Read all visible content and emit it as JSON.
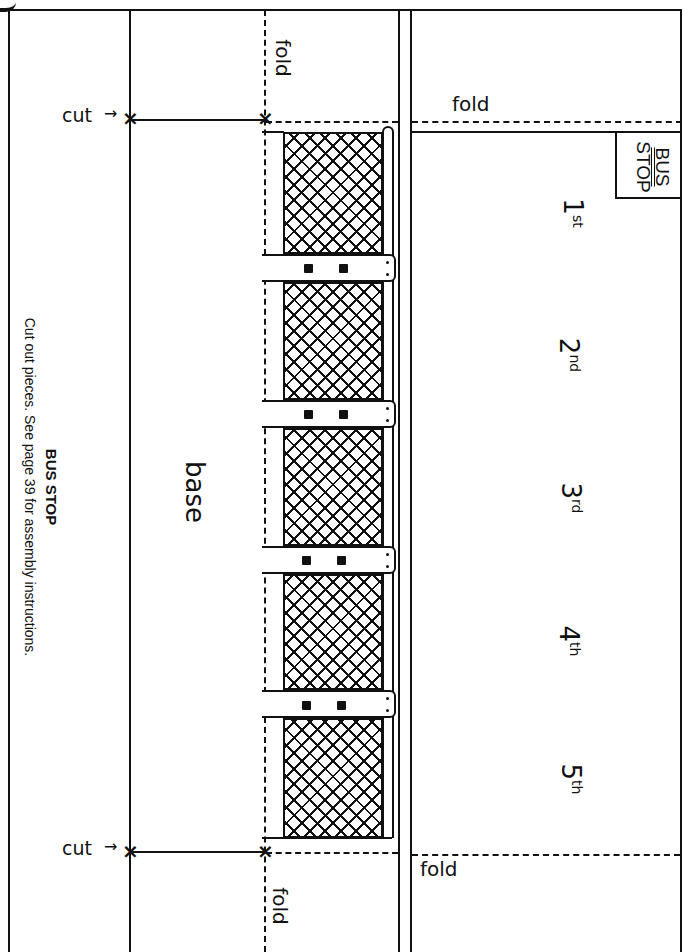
{
  "page": {
    "title": "BUS STOP",
    "instructions": "Cut out pieces. See page 39 for assembly instructions."
  },
  "labels": {
    "cut_top": "cut",
    "cut_bottom": "cut",
    "fold_top_vertical": "fold",
    "fold_top_horizontal": "fold",
    "fold_bottom_vertical": "fold",
    "fold_bottom_horizontal": "fold",
    "base": "base"
  },
  "sign": {
    "line1": "BUS",
    "line2": "STOP"
  },
  "floors": [
    {
      "num": "1",
      "suffix": "st"
    },
    {
      "num": "2",
      "suffix": "nd"
    },
    {
      "num": "3",
      "suffix": "rd"
    },
    {
      "num": "4",
      "suffix": "th"
    },
    {
      "num": "5",
      "suffix": "th"
    }
  ],
  "panels": {
    "mesh_count": 5,
    "bracket_count": 4
  }
}
